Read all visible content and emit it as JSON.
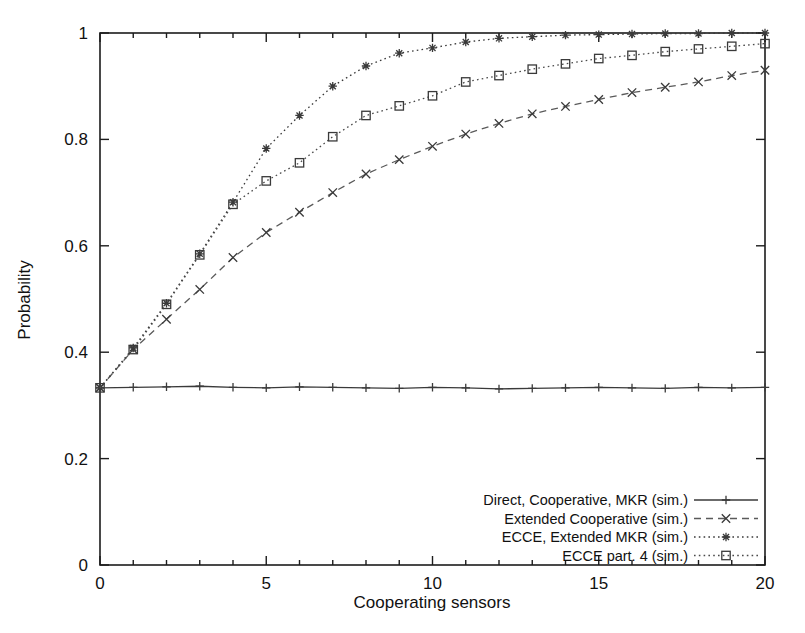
{
  "chart_data": {
    "type": "line",
    "title": "",
    "xlabel": "Cooperating sensors",
    "ylabel": "Probability",
    "xlim": [
      0,
      20
    ],
    "ylim": [
      0,
      1
    ],
    "xticks": [
      "0",
      "5",
      "10",
      "15",
      "20"
    ],
    "xtick_values": [
      0,
      5,
      10,
      15,
      20
    ],
    "yticks": [
      "0",
      "0.2",
      "0.4",
      "0.6",
      "0.8",
      "1"
    ],
    "ytick_values": [
      0,
      0.2,
      0.4,
      0.6,
      0.8,
      1
    ],
    "grid": false,
    "legend_position": "bottom-right inside plot",
    "x": [
      0,
      1,
      2,
      3,
      4,
      5,
      6,
      7,
      8,
      9,
      10,
      11,
      12,
      13,
      14,
      15,
      16,
      17,
      18,
      19,
      20
    ],
    "series": [
      {
        "name": "Direct, Cooperative, MKR (sim.)",
        "marker": "plus",
        "dash": "solid",
        "color": "#3a3a3a",
        "values": [
          0.333,
          0.334,
          0.335,
          0.336,
          0.334,
          0.333,
          0.335,
          0.334,
          0.333,
          0.332,
          0.334,
          0.333,
          0.331,
          0.332,
          0.333,
          0.334,
          0.333,
          0.332,
          0.334,
          0.333,
          0.334
        ]
      },
      {
        "name": "Extended Cooperative (sim.)",
        "marker": "cross",
        "dash": "dashed",
        "color": "#5a5a5a",
        "values": [
          0.333,
          0.405,
          0.462,
          0.518,
          0.578,
          0.625,
          0.663,
          0.7,
          0.735,
          0.762,
          0.787,
          0.81,
          0.83,
          0.848,
          0.862,
          0.875,
          0.888,
          0.898,
          0.908,
          0.92,
          0.93
        ]
      },
      {
        "name": "ECCE, Extended MKR (sim.)",
        "marker": "star",
        "dash": "dotted",
        "color": "#3a3a3a",
        "values": [
          0.333,
          0.408,
          0.492,
          0.585,
          0.682,
          0.783,
          0.845,
          0.9,
          0.938,
          0.962,
          0.972,
          0.983,
          0.99,
          0.993,
          0.996,
          0.997,
          0.998,
          0.999,
          0.999,
          1.0,
          1.0
        ]
      },
      {
        "name": "ECCE part. 4 (sim.)",
        "marker": "square",
        "dash": "dotted",
        "color": "#4a4a4a",
        "values": [
          0.333,
          0.405,
          0.49,
          0.583,
          0.678,
          0.722,
          0.756,
          0.805,
          0.845,
          0.863,
          0.882,
          0.908,
          0.92,
          0.932,
          0.942,
          0.952,
          0.958,
          0.965,
          0.97,
          0.975,
          0.98
        ]
      }
    ]
  },
  "legend": {
    "entries": [
      {
        "label": "Direct, Cooperative, MKR (sim.)"
      },
      {
        "label": "Extended Cooperative (sim.)"
      },
      {
        "label": "ECCE, Extended MKR (sim.)"
      },
      {
        "label": "ECCE part. 4 (sim.)"
      }
    ]
  }
}
